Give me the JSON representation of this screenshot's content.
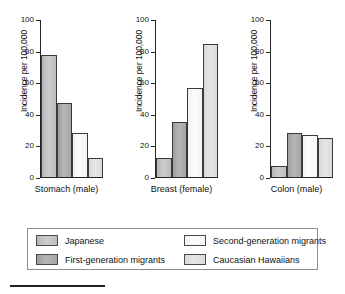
{
  "chart_data": {
    "type": "bar",
    "title": "",
    "xlabel": "",
    "ylabel": "Incidence per 100,000",
    "ylim": [
      0,
      100
    ],
    "yticks": [
      0,
      20,
      40,
      60,
      80,
      100
    ],
    "grid": false,
    "legend_position": "bottom",
    "categories": [
      "Stomach (male)",
      "Breast (female)",
      "Colon (male)"
    ],
    "series": [
      {
        "name": "Japanese",
        "values": [
          78,
          12,
          7
        ],
        "color": "#c2c2c2"
      },
      {
        "name": "First-generation migrants",
        "values": [
          47,
          35,
          28
        ],
        "color": "#a8a8a8"
      },
      {
        "name": "Second-generation migrants",
        "values": [
          28,
          57,
          27
        ],
        "color": "#f7f7f7"
      },
      {
        "name": "Caucasian Hawaiians",
        "values": [
          12,
          85,
          25
        ],
        "color": "#e0e0e0"
      }
    ],
    "panels": [
      {
        "xlabel": "Stomach (male)",
        "ylabel": "Incidence per 100,000",
        "values": [
          78,
          47,
          28,
          12
        ]
      },
      {
        "xlabel": "Breast (female)",
        "ylabel": "Incidence per 100,000",
        "values": [
          12,
          35,
          57,
          85
        ]
      },
      {
        "xlabel": "Colon (male)",
        "ylabel": "Incidence per 100,000",
        "values": [
          7,
          28,
          27,
          25
        ]
      }
    ]
  },
  "axis": {
    "tick_100": "100",
    "tick_80": "80",
    "tick_60": "60",
    "tick_40": "40",
    "tick_20": "20",
    "tick_0": "0"
  },
  "legend": {
    "items": [
      {
        "label": "Japanese"
      },
      {
        "label": "Second-generation migrants"
      },
      {
        "label": "First-generation migrants"
      },
      {
        "label": "Caucasian Hawaiians"
      }
    ]
  }
}
